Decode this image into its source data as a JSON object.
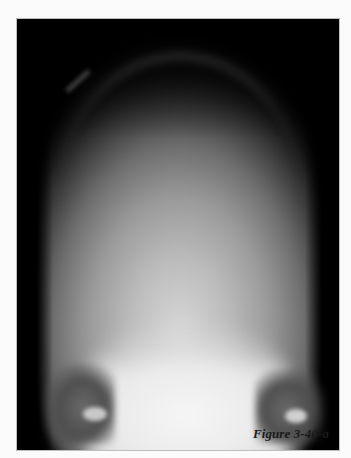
{
  "figure": {
    "caption": "Figure 3-40-a",
    "image_description": "Radiograph (X-ray) of skull, posteroanterior view",
    "colors": {
      "page_background": "#fbfbfb",
      "frame_background": "#000000",
      "caption_text": "#1a1a1a"
    }
  }
}
